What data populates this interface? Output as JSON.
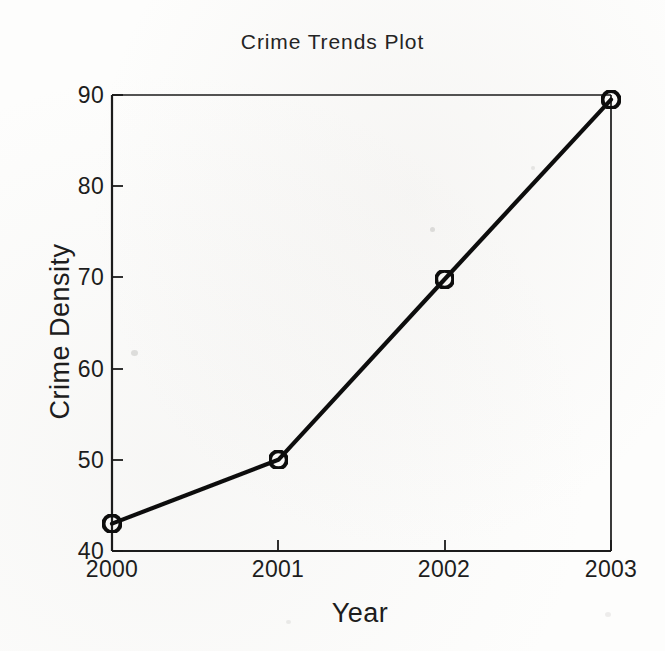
{
  "chart_data": {
    "type": "line",
    "title": "Crime Trends Plot",
    "xlabel": "Year",
    "ylabel": "Crime Density",
    "categories": [
      "2000",
      "2001",
      "2002",
      "2003"
    ],
    "x": [
      2000,
      2001,
      2002,
      2003
    ],
    "values": [
      43,
      50,
      69.8,
      89.5
    ],
    "series": [
      {
        "name": "Crime Density",
        "values": [
          43,
          50,
          69.8,
          89.5
        ]
      }
    ],
    "xlim": [
      2000,
      2003
    ],
    "ylim": [
      40,
      90
    ],
    "yticks": [
      40,
      50,
      60,
      70,
      80,
      90
    ],
    "ytick_labels": [
      "40",
      "50",
      "60",
      "70",
      "80",
      "90"
    ],
    "xticks": [
      2000,
      2001,
      2002,
      2003
    ],
    "xtick_labels": [
      "2000",
      "2001",
      "2002",
      "2003"
    ],
    "grid": false,
    "legend": false,
    "legend_position": "none",
    "marker": "circle-open",
    "line_color": "#111111",
    "marker_color": "#111111",
    "background_color": "#ffffff",
    "tick_direction": "in",
    "annotations": []
  },
  "figure": {
    "title": "Crime Trends Plot",
    "axis_color": "#1a1a1a",
    "text_color": "#1d1d1d"
  }
}
